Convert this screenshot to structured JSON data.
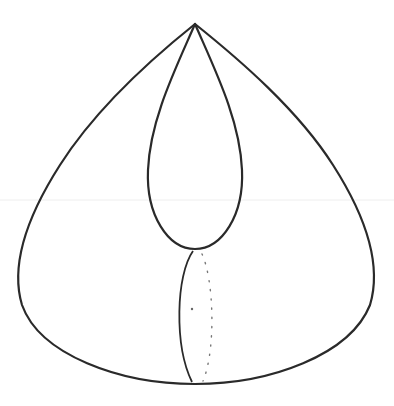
{
  "figure": {
    "stroke_color": "#2a2a2a",
    "background": "#ffffff",
    "apex": [
      195,
      24
    ],
    "outer_bottom": [
      195,
      384
    ],
    "inner_loop_bottom": [
      195,
      249
    ],
    "dot_marker": [
      192,
      309
    ]
  }
}
